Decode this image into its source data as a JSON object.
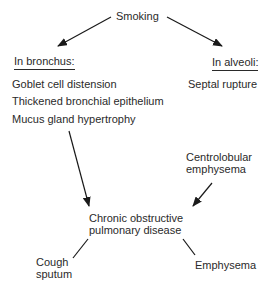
{
  "diagram": {
    "root": "Smoking",
    "left_heading": "In bronchus:",
    "left_items": [
      "Goblet cell distension",
      "Thickened bronchial epithelium",
      "Mucus gland hypertrophy"
    ],
    "right_heading": "In alveoli:",
    "right_items": [
      "Septal rupture"
    ],
    "side_node": [
      "Centrolobular",
      "emphysema"
    ],
    "center_node": [
      "Chronic obstructive",
      "pulmonary disease"
    ],
    "outcome_left": [
      "Cough",
      "sputum"
    ],
    "outcome_right": "Emphysema"
  }
}
